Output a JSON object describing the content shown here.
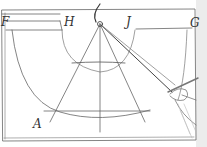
{
  "diagram": {
    "labels": {
      "F": "F",
      "H": "H",
      "J": "J",
      "G": "G",
      "A": "A"
    },
    "colors": {
      "stroke": "#555555",
      "light_stroke": "#9a9a9a",
      "background": "#ffffff",
      "margin": "#e8e8e8"
    },
    "elements": [
      "outer-rectangle",
      "top-band-H-to-G",
      "semicircle-arc",
      "vertical-axis",
      "converging-lines-from-apex",
      "horizontal-chords",
      "compass-arc-at-apex",
      "hand-holding-pen"
    ]
  }
}
